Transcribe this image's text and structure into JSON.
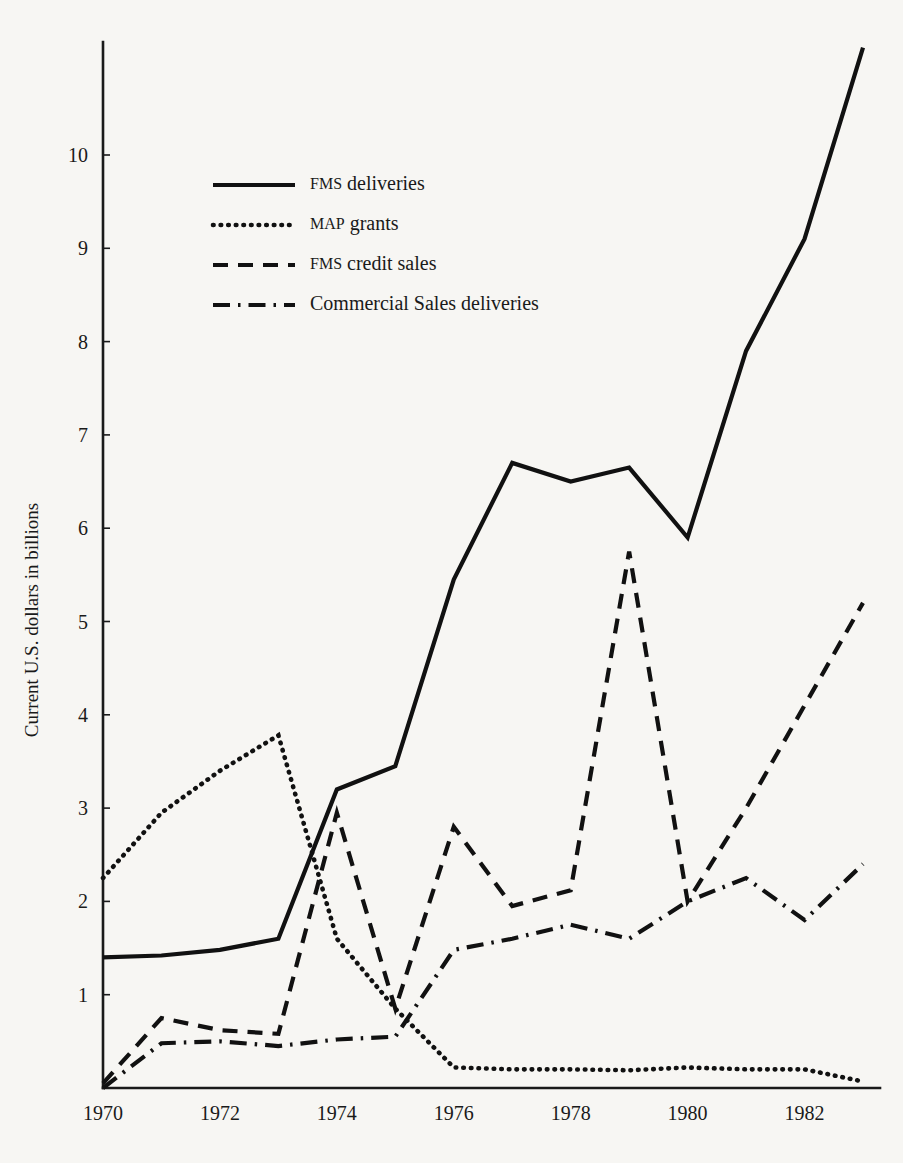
{
  "chart_data": {
    "type": "line",
    "title": "",
    "xlabel": "",
    "ylabel": "Current U.S. dollars in billions",
    "x": [
      1970,
      1971,
      1972,
      1973,
      1974,
      1975,
      1976,
      1977,
      1978,
      1979,
      1980,
      1981,
      1982,
      1983
    ],
    "xlim": [
      1970,
      1983
    ],
    "ylim": [
      0,
      11.2
    ],
    "grid": false,
    "legend_position": "upper-left-inside",
    "xtick_labels": [
      "1970",
      "1972",
      "1974",
      "1976",
      "1978",
      "1980",
      "1982"
    ],
    "xtick_values": [
      1970,
      1972,
      1974,
      1976,
      1978,
      1980,
      1982
    ],
    "ytick_labels": [
      "1",
      "2",
      "3",
      "4",
      "5",
      "6",
      "7",
      "8",
      "9",
      "10"
    ],
    "ytick_values": [
      1,
      2,
      3,
      4,
      5,
      6,
      7,
      8,
      9,
      10
    ],
    "series": [
      {
        "name": "FMS deliveries",
        "style": "solid",
        "values": [
          1.4,
          1.42,
          1.48,
          1.6,
          3.2,
          3.45,
          5.45,
          6.7,
          6.5,
          6.65,
          5.9,
          7.9,
          9.1,
          11.15
        ]
      },
      {
        "name": "MAP grants",
        "style": "dotted",
        "values": [
          2.25,
          2.95,
          3.4,
          3.78,
          1.6,
          0.85,
          0.22,
          0.2,
          0.2,
          0.19,
          0.22,
          0.2,
          0.2,
          0.07
        ]
      },
      {
        "name": "FMS credit sales",
        "style": "dashed",
        "values": [
          0.05,
          0.75,
          0.62,
          0.58,
          2.95,
          0.85,
          2.8,
          1.95,
          2.12,
          5.75,
          2.0,
          3.0,
          4.1,
          5.2
        ]
      },
      {
        "name": "Commercial Sales deliveries",
        "style": "dash-dot",
        "values": [
          0.0,
          0.48,
          0.5,
          0.45,
          0.52,
          0.55,
          1.48,
          1.6,
          1.75,
          1.6,
          2.0,
          2.25,
          1.8,
          2.4
        ]
      }
    ]
  },
  "legend": {
    "entries": [
      {
        "label_prefix": "FMS",
        "label_rest": " deliveries",
        "style": "solid"
      },
      {
        "label_prefix": "MAP",
        "label_rest": " grants",
        "style": "dotted"
      },
      {
        "label_prefix": "FMS",
        "label_rest": " credit sales",
        "style": "dashed"
      },
      {
        "label_prefix": "",
        "label_rest": "Commercial Sales deliveries",
        "style": "dash-dot"
      }
    ]
  },
  "colors": {
    "ink": "#111111",
    "background": "#f7f6f3"
  }
}
